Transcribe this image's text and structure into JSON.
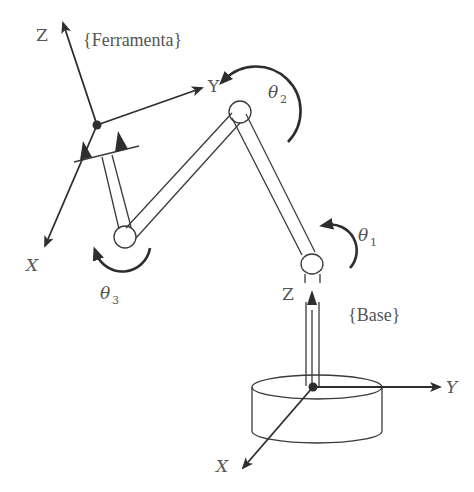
{
  "diagram": {
    "frames": {
      "tool": {
        "label": "{Ferramenta}",
        "axes": {
          "z": "Z",
          "y": "Y",
          "x": "X"
        }
      },
      "base": {
        "label": "{Base}",
        "axes": {
          "z": "Z",
          "y": "Y",
          "x": "X"
        }
      }
    },
    "joints": [
      {
        "id": "theta1",
        "symbol": "θ",
        "subscript": "1"
      },
      {
        "id": "theta2",
        "symbol": "θ",
        "subscript": "2"
      },
      {
        "id": "theta3",
        "symbol": "θ",
        "subscript": "3"
      }
    ],
    "colors": {
      "line": "#3a3a3a",
      "text": "#555555",
      "background": "#ffffff"
    }
  }
}
